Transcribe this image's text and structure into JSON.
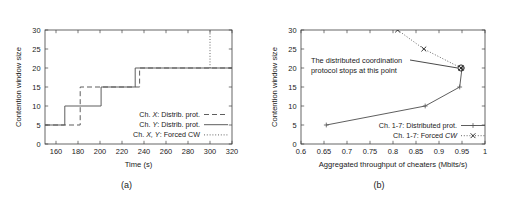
{
  "figure": {
    "panels": [
      {
        "id": "a",
        "caption": "(a)",
        "chart_data": {
          "type": "line",
          "title": "",
          "xlabel": "Time (s)",
          "ylabel": "Contention window size",
          "xlim": [
            150,
            320
          ],
          "ylim": [
            0,
            30
          ],
          "xticks": [
            160,
            180,
            200,
            220,
            240,
            260,
            280,
            300,
            320
          ],
          "xtick_labels": [
            "160",
            "180",
            "200",
            "220",
            "240",
            "260",
            "280",
            "300",
            "320"
          ],
          "yticks": [
            0,
            5,
            10,
            15,
            20,
            25,
            30
          ],
          "ytick_labels": [
            "0",
            "5",
            "10",
            "15",
            "20",
            "25",
            "30"
          ],
          "grid": false,
          "legend_position": "lower right",
          "series": [
            {
              "name": "Ch. X: Distrib. prot.",
              "style": "dashed",
              "step": true,
              "x": [
                150,
                182,
                182,
                236,
                236,
                320
              ],
              "y": [
                5,
                5,
                15,
                15,
                20,
                20
              ]
            },
            {
              "name": "Ch. Y: Distrib. prot.",
              "style": "solid",
              "step": true,
              "x": [
                150,
                168,
                168,
                201,
                201,
                232,
                232,
                320
              ],
              "y": [
                5,
                5,
                10,
                10,
                15,
                15,
                20,
                20
              ]
            },
            {
              "name": "Ch. X, Y: Forced CW",
              "style": "dotted",
              "step": true,
              "x": [
                300,
                300
              ],
              "y": [
                20,
                30
              ]
            }
          ]
        },
        "legend": [
          {
            "label_prefix": "Ch. ",
            "label_italic": "X",
            "label_suffix": ": Distrib. prot.",
            "style": "dashed"
          },
          {
            "label_prefix": "Ch. ",
            "label_italic": "Y",
            "label_suffix": ": Distrib. prot.",
            "style": "solid"
          },
          {
            "label_prefix": "Ch. ",
            "label_italic": "X, Y",
            "label_suffix": ": Forced CW",
            "style": "dotted"
          }
        ]
      },
      {
        "id": "b",
        "caption": "(b)",
        "annotation": {
          "line1": "The distributed coordination",
          "line2": "protocol stops at this point"
        },
        "chart_data": {
          "type": "line",
          "title": "",
          "xlabel": "Aggregated throughput of cheaters (Mbits/s)",
          "ylabel": "Contention window size",
          "xlim": [
            0.6,
            1.0
          ],
          "ylim": [
            0,
            30
          ],
          "xticks": [
            0.6,
            0.65,
            0.7,
            0.75,
            0.8,
            0.85,
            0.9,
            0.95,
            1.0
          ],
          "xtick_labels": [
            "0.6",
            "0.65",
            "0.7",
            "0.75",
            "0.8",
            "0.85",
            "0.9",
            "0.95",
            "1"
          ],
          "yticks": [
            0,
            5,
            10,
            15,
            20,
            25,
            30
          ],
          "ytick_labels": [
            "0",
            "5",
            "10",
            "15",
            "20",
            "25",
            "30"
          ],
          "grid": false,
          "legend_position": "lower right",
          "series": [
            {
              "name": "Ch. 1-7: Distributed prot.",
              "style": "solid",
              "marker": "plus",
              "x": [
                0.655,
                0.87,
                0.945,
                0.95
              ],
              "y": [
                5,
                10,
                15,
                20
              ]
            },
            {
              "name": "Ch. 1-7: Forced CW",
              "style": "dotted",
              "marker": "cross",
              "x": [
                0.81,
                0.867,
                0.948
              ],
              "y": [
                30,
                25,
                20
              ]
            }
          ],
          "highlight_point": {
            "x": 0.948,
            "y": 20,
            "marker": "circled"
          }
        },
        "legend": [
          {
            "label_prefix": "Ch. 1-7: Distributed prot.",
            "label_italic": "",
            "label_suffix": "",
            "style": "solid",
            "marker": "plus"
          },
          {
            "label_prefix": "Ch. 1-7: Forced ",
            "label_italic": "CW",
            "label_suffix": "",
            "style": "dotted",
            "marker": "cross"
          }
        ]
      }
    ]
  },
  "colors": {
    "ink": "#1a1a1a",
    "axis": "#404040",
    "line": "#555555",
    "background": "#ffffff"
  }
}
